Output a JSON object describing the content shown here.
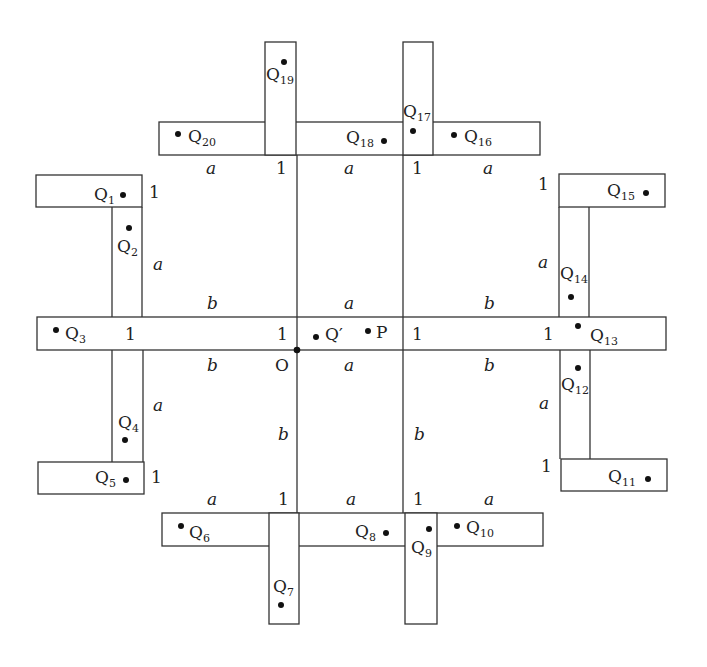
{
  "diagram": {
    "colors": {
      "stroke": "#333333",
      "text": "#222222",
      "background": "#ffffff"
    },
    "dimension_labels": {
      "top_row": [
        "a",
        "1",
        "a",
        "1",
        "a"
      ],
      "bottom_row": [
        "a",
        "1",
        "a",
        "1",
        "a"
      ],
      "left_col": [
        "1",
        "a",
        "b",
        "b",
        "a",
        "1"
      ],
      "right_col": [
        "1",
        "a",
        "b",
        "b",
        "a",
        "1"
      ],
      "center_above": "a",
      "center_below": "a",
      "center_vertical_left": "b",
      "center_vertical_right": "b",
      "bar_ones": [
        "1",
        "1",
        "1",
        "1"
      ]
    },
    "origin_label": "O",
    "center_points": {
      "q_prime": "Q′",
      "p": "P"
    },
    "points": [
      {
        "id": "1",
        "label": "Q",
        "sub": "1"
      },
      {
        "id": "2",
        "label": "Q",
        "sub": "2"
      },
      {
        "id": "3",
        "label": "Q",
        "sub": "3"
      },
      {
        "id": "4",
        "label": "Q",
        "sub": "4"
      },
      {
        "id": "5",
        "label": "Q",
        "sub": "5"
      },
      {
        "id": "6",
        "label": "Q",
        "sub": "6"
      },
      {
        "id": "7",
        "label": "Q",
        "sub": "7"
      },
      {
        "id": "8",
        "label": "Q",
        "sub": "8"
      },
      {
        "id": "9",
        "label": "Q",
        "sub": "9"
      },
      {
        "id": "10",
        "label": "Q",
        "sub": "10"
      },
      {
        "id": "11",
        "label": "Q",
        "sub": "11"
      },
      {
        "id": "12",
        "label": "Q",
        "sub": "12"
      },
      {
        "id": "13",
        "label": "Q",
        "sub": "13"
      },
      {
        "id": "14",
        "label": "Q",
        "sub": "14"
      },
      {
        "id": "15",
        "label": "Q",
        "sub": "15"
      },
      {
        "id": "16",
        "label": "Q",
        "sub": "16"
      },
      {
        "id": "17",
        "label": "Q",
        "sub": "17"
      },
      {
        "id": "18",
        "label": "Q",
        "sub": "18"
      },
      {
        "id": "19",
        "label": "Q",
        "sub": "19"
      },
      {
        "id": "20",
        "label": "Q",
        "sub": "20"
      }
    ]
  }
}
